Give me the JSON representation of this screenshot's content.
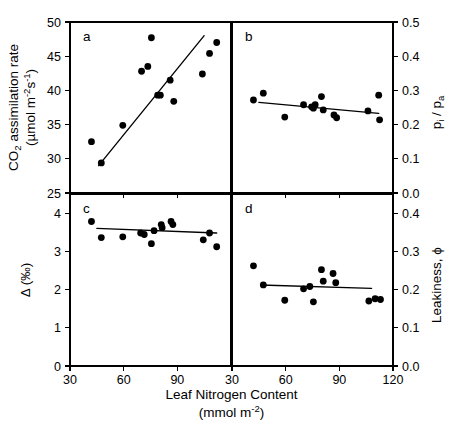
{
  "figure": {
    "width": 457,
    "height": 426,
    "background": "#ffffff",
    "ink_color": "#000000"
  },
  "axes": {
    "x_title_line1": "Leaf Nitrogen Content",
    "x_title_line2_prefix": "(mmol m",
    "x_title_line2_sup": "-2",
    "x_title_line2_suffix": ")",
    "x_ticks_left_panel": [
      "30",
      "60",
      "90"
    ],
    "x_ticks_right_panel": [
      "30",
      "60",
      "90",
      "120"
    ],
    "x_min": 30,
    "x_max": 120
  },
  "chart_data": [
    {
      "type": "scatter",
      "panel": "a",
      "title": "",
      "xlabel": "Leaf Nitrogen Content (mmol m-2)",
      "ylabel": "CO2 assimilation rate (umol m-2 s-1)",
      "ylabel_line1": "CO",
      "ylabel_line1_sub": "2",
      "ylabel_line1_rest": " assimilation rate",
      "ylabel_line2_prefix": "(µmol m",
      "ylabel_line2_sup1": "-2",
      "ylabel_line2_mid": "s",
      "ylabel_line2_sup2": "-1",
      "ylabel_line2_suffix": ")",
      "y_side": "left",
      "xlim": [
        30,
        120
      ],
      "ylim": [
        25,
        50
      ],
      "yticks": [
        "25",
        "30",
        "35",
        "40",
        "45",
        "50"
      ],
      "ytick_values": [
        25,
        30,
        35,
        40,
        45,
        50
      ],
      "xticks": [
        "30",
        "60",
        "90"
      ],
      "xtick_values": [
        30,
        60,
        90
      ],
      "grid": false,
      "points": [
        {
          "x": 42.0,
          "y": 32.5
        },
        {
          "x": 47.5,
          "y": 29.4
        },
        {
          "x": 59.5,
          "y": 34.9
        },
        {
          "x": 70.0,
          "y": 42.8
        },
        {
          "x": 73.5,
          "y": 43.5
        },
        {
          "x": 75.5,
          "y": 47.7
        },
        {
          "x": 79.0,
          "y": 39.3
        },
        {
          "x": 80.5,
          "y": 39.3
        },
        {
          "x": 86.0,
          "y": 41.5
        },
        {
          "x": 88.0,
          "y": 38.4
        },
        {
          "x": 104.0,
          "y": 42.4
        },
        {
          "x": 108.0,
          "y": 45.4
        },
        {
          "x": 112.0,
          "y": 47.0
        }
      ],
      "fit_line": {
        "x1": 46.0,
        "y1": 29.0,
        "x2": 105.0,
        "y2": 48.0
      }
    },
    {
      "type": "scatter",
      "panel": "b",
      "title": "",
      "xlabel": "Leaf Nitrogen Content (mmol m-2)",
      "ylabel": "pi / pa",
      "ylabel_prefix": "p",
      "ylabel_sub1": "i",
      "ylabel_mid": " / p",
      "ylabel_sub2": "a",
      "y_side": "right",
      "xlim": [
        30,
        120
      ],
      "ylim": [
        0.0,
        0.5
      ],
      "yticks": [
        "0.0",
        "0.1",
        "0.2",
        "0.3",
        "0.4",
        "0.5"
      ],
      "ytick_values": [
        0.0,
        0.1,
        0.2,
        0.3,
        0.4,
        0.5
      ],
      "xticks": [
        "30",
        "60",
        "90"
      ],
      "xtick_values": [
        30,
        60,
        90
      ],
      "grid": false,
      "points": [
        {
          "x": 42.0,
          "y": 0.272
        },
        {
          "x": 47.5,
          "y": 0.292
        },
        {
          "x": 59.5,
          "y": 0.222
        },
        {
          "x": 70.0,
          "y": 0.258
        },
        {
          "x": 74.5,
          "y": 0.252
        },
        {
          "x": 75.5,
          "y": 0.248
        },
        {
          "x": 76.5,
          "y": 0.258
        },
        {
          "x": 80.0,
          "y": 0.282
        },
        {
          "x": 81.0,
          "y": 0.243
        },
        {
          "x": 87.0,
          "y": 0.228
        },
        {
          "x": 88.5,
          "y": 0.22
        },
        {
          "x": 106.0,
          "y": 0.24
        },
        {
          "x": 112.0,
          "y": 0.286
        },
        {
          "x": 112.5,
          "y": 0.214
        }
      ],
      "fit_line": {
        "x1": 45.0,
        "y1": 0.265,
        "x2": 112.0,
        "y2": 0.233
      }
    },
    {
      "type": "scatter",
      "panel": "c",
      "title": "",
      "xlabel": "Leaf Nitrogen Content (mmol m-2)",
      "ylabel": "Δ (‰)",
      "ylabel_text": "Δ (‰)",
      "y_side": "left",
      "xlim": [
        30,
        120
      ],
      "ylim": [
        0,
        4.5
      ],
      "yticks": [
        "0",
        "1",
        "2",
        "3",
        "4"
      ],
      "ytick_values": [
        0,
        1,
        2,
        3,
        4
      ],
      "xticks": [
        "30",
        "60",
        "90"
      ],
      "xtick_values": [
        30,
        60,
        90
      ],
      "grid": false,
      "points": [
        {
          "x": 42.0,
          "y": 3.78
        },
        {
          "x": 47.5,
          "y": 3.36
        },
        {
          "x": 59.5,
          "y": 3.38
        },
        {
          "x": 69.5,
          "y": 3.48
        },
        {
          "x": 71.5,
          "y": 3.44
        },
        {
          "x": 75.5,
          "y": 3.2
        },
        {
          "x": 77.0,
          "y": 3.54
        },
        {
          "x": 81.0,
          "y": 3.7
        },
        {
          "x": 81.5,
          "y": 3.62
        },
        {
          "x": 86.5,
          "y": 3.78
        },
        {
          "x": 87.5,
          "y": 3.7
        },
        {
          "x": 104.5,
          "y": 3.3
        },
        {
          "x": 108.0,
          "y": 3.48
        },
        {
          "x": 112.0,
          "y": 3.12
        }
      ],
      "fit_line": {
        "x1": 45.0,
        "y1": 3.6,
        "x2": 112.0,
        "y2": 3.48
      }
    },
    {
      "type": "scatter",
      "panel": "d",
      "title": "",
      "xlabel": "Leaf Nitrogen Content (mmol m-2)",
      "ylabel": "Leakiness, ϕ",
      "ylabel_text": "Leakiness, ϕ",
      "y_side": "right",
      "xlim": [
        30,
        120
      ],
      "ylim": [
        0.0,
        0.45
      ],
      "yticks": [
        "0.0",
        "0.1",
        "0.2",
        "0.3",
        "0.4"
      ],
      "ytick_values": [
        0.0,
        0.1,
        0.2,
        0.3,
        0.4
      ],
      "xticks": [
        "30",
        "60",
        "90",
        "120"
      ],
      "xtick_values": [
        30,
        60,
        90,
        120
      ],
      "grid": false,
      "points": [
        {
          "x": 42.0,
          "y": 0.262
        },
        {
          "x": 47.5,
          "y": 0.212
        },
        {
          "x": 59.5,
          "y": 0.172
        },
        {
          "x": 70.0,
          "y": 0.202
        },
        {
          "x": 73.5,
          "y": 0.208
        },
        {
          "x": 75.5,
          "y": 0.168
        },
        {
          "x": 80.0,
          "y": 0.252
        },
        {
          "x": 81.0,
          "y": 0.222
        },
        {
          "x": 86.5,
          "y": 0.242
        },
        {
          "x": 88.0,
          "y": 0.218
        },
        {
          "x": 106.5,
          "y": 0.17
        },
        {
          "x": 110.0,
          "y": 0.176
        },
        {
          "x": 113.0,
          "y": 0.174
        }
      ],
      "fit_line": {
        "x1": 46.0,
        "y1": 0.212,
        "x2": 108.0,
        "y2": 0.203
      }
    }
  ]
}
